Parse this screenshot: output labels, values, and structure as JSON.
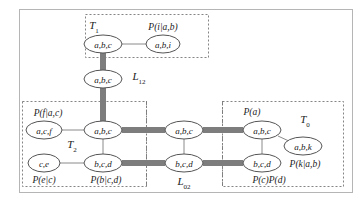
{
  "figure": {
    "type": "junction-tree-diagram",
    "outer_frame": {
      "color": "#b5b5b5"
    },
    "colors": {
      "ellipse_stroke": "#555555",
      "thin_edge": "#8a8a8a",
      "thick_edge": "#7d7d7d",
      "dashed_box": "#777777",
      "text": "#1a1a1a"
    }
  },
  "boxes": [
    {
      "id": "T1",
      "label": "T",
      "sub": "1",
      "label_x": 94,
      "label_y": 27,
      "x": 85,
      "y": 14,
      "w": 123,
      "h": 43,
      "style": "dashed"
    },
    {
      "id": "T2",
      "label": "T",
      "sub": "2",
      "label_x": 72,
      "label_y": 146,
      "x": 22,
      "y": 101,
      "w": 124,
      "h": 85,
      "style": "dashed"
    },
    {
      "id": "T0",
      "label": "T",
      "sub": "0",
      "label_x": 305,
      "label_y": 121,
      "x": 222,
      "y": 101,
      "w": 121,
      "h": 85,
      "style": "dashed"
    }
  ],
  "separator_columns": [
    {
      "id": "L02",
      "x_left": 146,
      "x_right": 222,
      "y_top": 101,
      "y_bottom": 186
    }
  ],
  "nodes": [
    {
      "id": "n_t1_abc",
      "text": "a,b,c",
      "cx": 103,
      "cy": 44,
      "rx": 19,
      "ry": 9
    },
    {
      "id": "n_t1_abi",
      "text": "a,b,i",
      "cx": 163,
      "cy": 44,
      "rx": 17,
      "ry": 9
    },
    {
      "id": "n_l12_abc",
      "text": "a,b,c",
      "cx": 103,
      "cy": 79,
      "rx": 19,
      "ry": 9
    },
    {
      "id": "n_t2_acf",
      "text": "a,c,f",
      "cx": 44,
      "cy": 130,
      "rx": 18,
      "ry": 9
    },
    {
      "id": "n_t2_abc",
      "text": "a,b,c",
      "cx": 103,
      "cy": 130,
      "rx": 19,
      "ry": 9
    },
    {
      "id": "n_t2_ce",
      "text": "c,e",
      "cx": 44,
      "cy": 163,
      "rx": 16,
      "ry": 9
    },
    {
      "id": "n_t2_bcd",
      "text": "b,c,d",
      "cx": 103,
      "cy": 163,
      "rx": 19,
      "ry": 9
    },
    {
      "id": "n_l02_abc",
      "text": "a,b,c",
      "cx": 184,
      "cy": 130,
      "rx": 19,
      "ry": 9
    },
    {
      "id": "n_l02_bcd",
      "text": "b,c,d",
      "cx": 184,
      "cy": 163,
      "rx": 19,
      "ry": 9
    },
    {
      "id": "n_t0_abc",
      "text": "a,b,c",
      "cx": 262,
      "cy": 130,
      "rx": 19,
      "ry": 9
    },
    {
      "id": "n_t0_bcd",
      "text": "b,c,d",
      "cx": 262,
      "cy": 163,
      "rx": 19,
      "ry": 9
    },
    {
      "id": "n_t0_abk",
      "text": "a,b,k",
      "cx": 303,
      "cy": 146,
      "rx": 19,
      "ry": 9
    }
  ],
  "thin_edges": [
    {
      "from": "n_t1_abc",
      "to": "n_t1_abi",
      "x1": 122,
      "y1": 44,
      "x2": 146,
      "y2": 44
    },
    {
      "from": "n_t2_acf",
      "to": "n_t2_abc",
      "x1": 62,
      "y1": 130,
      "x2": 84,
      "y2": 130
    },
    {
      "from": "n_t2_ce",
      "to": "n_t2_bcd",
      "x1": 60,
      "y1": 163,
      "x2": 84,
      "y2": 163
    },
    {
      "from": "n_t2_abc",
      "to": "n_t2_bcd",
      "x1": 103,
      "y1": 139,
      "x2": 103,
      "y2": 154
    },
    {
      "from": "n_l02_abc",
      "to": "n_l02_bcd",
      "x1": 184,
      "y1": 139,
      "x2": 184,
      "y2": 154
    },
    {
      "from": "n_t0_abc",
      "to": "n_t0_bcd",
      "x1": 262,
      "y1": 139,
      "x2": 262,
      "y2": 154
    },
    {
      "from": "n_t0_abc",
      "to": "n_t0_abk",
      "x1": 278,
      "y1": 136,
      "x2": 291,
      "y2": 142
    }
  ],
  "thick_edges": [
    {
      "from": "n_t1_abc",
      "to": "n_l12_abc",
      "x1": 103,
      "y1": 53,
      "x2": 103,
      "y2": 70,
      "orient": "v"
    },
    {
      "from": "n_l12_abc",
      "to": "n_t2_abc",
      "x1": 103,
      "y1": 88,
      "x2": 103,
      "y2": 121,
      "orient": "v"
    },
    {
      "from": "n_t2_abc",
      "to": "n_l02_abc",
      "x1": 122,
      "y1": 130,
      "x2": 165,
      "y2": 130,
      "orient": "h"
    },
    {
      "from": "n_l02_abc",
      "to": "n_t0_abc",
      "x1": 203,
      "y1": 130,
      "x2": 243,
      "y2": 130,
      "orient": "h"
    },
    {
      "from": "n_t2_bcd",
      "to": "n_l02_bcd",
      "x1": 122,
      "y1": 163,
      "x2": 165,
      "y2": 163,
      "orient": "h"
    },
    {
      "from": "n_l02_bcd",
      "to": "n_t0_bcd",
      "x1": 203,
      "y1": 163,
      "x2": 243,
      "y2": 163,
      "orient": "h"
    }
  ],
  "potential_labels": [
    {
      "id": "p_i_ab",
      "text": "P(i|a,b)",
      "x": 163,
      "y": 27
    },
    {
      "id": "p_f_ac",
      "text": "P(f|a,c)",
      "x": 48,
      "y": 113
    },
    {
      "id": "p_e_c",
      "text": "P(e|c)",
      "x": 44,
      "y": 180
    },
    {
      "id": "p_b_cd",
      "text": "P(b|c,d)",
      "x": 106,
      "y": 180
    },
    {
      "id": "p_a",
      "text": "P(a)",
      "x": 252,
      "y": 112
    },
    {
      "id": "p_k_ab",
      "text": "P(k|a,b)",
      "x": 305,
      "y": 164
    },
    {
      "id": "p_c_d",
      "text": "P(c)P(d)",
      "x": 269,
      "y": 180
    }
  ],
  "separator_labels": [
    {
      "id": "L12",
      "base": "L",
      "sub": "12",
      "x": 139,
      "y": 78
    },
    {
      "id": "L02",
      "base": "L",
      "sub": "02",
      "x": 184,
      "y": 183
    }
  ]
}
